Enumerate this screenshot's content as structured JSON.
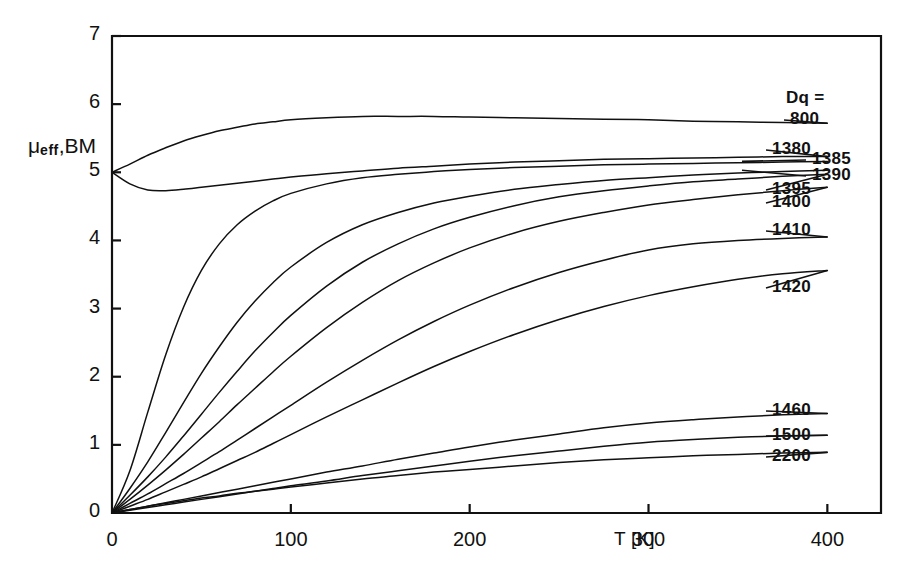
{
  "figure": {
    "background": "#ffffff",
    "line_color": "#111111",
    "frame": {
      "left": 112,
      "top": 36,
      "right": 881,
      "bottom": 513
    }
  },
  "axes": {
    "y_label_main": "eff",
    "y_label_prefix": "μ",
    "y_label_suffix": ",BM",
    "x_label": "T [K]",
    "y_ticks": [
      "0",
      "1",
      "2",
      "3",
      "4",
      "5",
      "6",
      "7"
    ],
    "x_ticks": [
      "0",
      "100",
      "200",
      "300",
      "400"
    ]
  },
  "legend": {
    "title": "Dq =",
    "entries": [
      "800",
      "1380",
      "1385",
      "1390",
      "1395",
      "1400",
      "1410",
      "1420",
      "1460",
      "1500",
      "2200"
    ]
  },
  "chart_data": {
    "type": "line",
    "title": "",
    "xlabel": "T [K]",
    "ylabel": "μ_eff, BM",
    "xlim": [
      0,
      430
    ],
    "ylim": [
      0,
      7
    ],
    "xticks": [
      0,
      100,
      200,
      300,
      400
    ],
    "yticks": [
      0,
      1,
      2,
      3,
      4,
      5,
      6,
      7
    ],
    "grid": false,
    "legend_position": "right-outside",
    "legend_title": "Dq =",
    "x": [
      0,
      10,
      20,
      30,
      40,
      50,
      60,
      70,
      80,
      90,
      100,
      120,
      140,
      160,
      180,
      200,
      225,
      250,
      275,
      300,
      325,
      350,
      375,
      400
    ],
    "series": [
      {
        "name": "800",
        "label": "800",
        "values": [
          5.0,
          5.12,
          5.25,
          5.36,
          5.46,
          5.54,
          5.61,
          5.66,
          5.71,
          5.74,
          5.77,
          5.8,
          5.82,
          5.82,
          5.82,
          5.81,
          5.8,
          5.79,
          5.78,
          5.77,
          5.75,
          5.74,
          5.73,
          5.72
        ]
      },
      {
        "name": "1380",
        "label": "1380",
        "values": [
          5.0,
          4.83,
          4.74,
          4.73,
          4.75,
          4.78,
          4.81,
          4.84,
          4.87,
          4.9,
          4.93,
          4.98,
          5.02,
          5.06,
          5.09,
          5.12,
          5.15,
          5.17,
          5.19,
          5.2,
          5.21,
          5.22,
          5.23,
          5.23
        ]
      },
      {
        "name": "1385",
        "label": "1385",
        "values": [
          0.0,
          0.62,
          1.48,
          2.32,
          3.02,
          3.56,
          3.95,
          4.23,
          4.43,
          4.58,
          4.69,
          4.83,
          4.92,
          4.97,
          5.01,
          5.04,
          5.07,
          5.09,
          5.11,
          5.12,
          5.13,
          5.14,
          5.15,
          5.16
        ]
      },
      {
        "name": "1390",
        "label": "1390",
        "values": [
          0.0,
          0.36,
          0.75,
          1.18,
          1.62,
          2.05,
          2.44,
          2.8,
          3.11,
          3.38,
          3.61,
          3.97,
          4.23,
          4.41,
          4.55,
          4.65,
          4.75,
          4.82,
          4.88,
          4.92,
          4.96,
          4.99,
          5.01,
          5.03
        ]
      },
      {
        "name": "1395",
        "label": "1395",
        "values": [
          0.0,
          0.26,
          0.53,
          0.82,
          1.13,
          1.45,
          1.77,
          2.08,
          2.38,
          2.65,
          2.9,
          3.33,
          3.68,
          3.95,
          4.17,
          4.34,
          4.51,
          4.64,
          4.73,
          4.8,
          4.86,
          4.9,
          4.94,
          4.97
        ]
      },
      {
        "name": "1400",
        "label": "1400",
        "values": [
          0.0,
          0.2,
          0.41,
          0.63,
          0.86,
          1.1,
          1.34,
          1.59,
          1.83,
          2.07,
          2.3,
          2.72,
          3.09,
          3.41,
          3.67,
          3.89,
          4.11,
          4.28,
          4.41,
          4.52,
          4.6,
          4.67,
          4.73,
          4.78
        ]
      },
      {
        "name": "1410",
        "label": "1410",
        "values": [
          0.0,
          0.14,
          0.28,
          0.43,
          0.58,
          0.74,
          0.9,
          1.07,
          1.24,
          1.41,
          1.58,
          1.92,
          2.24,
          2.54,
          2.81,
          3.05,
          3.31,
          3.53,
          3.71,
          3.86,
          3.95,
          4.0,
          4.03,
          4.05
        ]
      },
      {
        "name": "1420",
        "label": "1420",
        "values": [
          0.0,
          0.1,
          0.2,
          0.31,
          0.42,
          0.53,
          0.65,
          0.77,
          0.89,
          1.02,
          1.15,
          1.41,
          1.66,
          1.91,
          2.15,
          2.37,
          2.62,
          2.84,
          3.03,
          3.19,
          3.32,
          3.43,
          3.51,
          3.56
        ]
      },
      {
        "name": "1460",
        "label": "1460",
        "values": [
          0.0,
          0.05,
          0.1,
          0.15,
          0.2,
          0.25,
          0.3,
          0.35,
          0.4,
          0.45,
          0.5,
          0.6,
          0.69,
          0.79,
          0.88,
          0.97,
          1.07,
          1.16,
          1.25,
          1.32,
          1.37,
          1.41,
          1.44,
          1.46
        ]
      },
      {
        "name": "1500",
        "label": "1500",
        "values": [
          0.0,
          0.04,
          0.08,
          0.12,
          0.16,
          0.2,
          0.24,
          0.28,
          0.32,
          0.36,
          0.4,
          0.47,
          0.55,
          0.62,
          0.69,
          0.76,
          0.84,
          0.91,
          0.98,
          1.04,
          1.08,
          1.11,
          1.13,
          1.14
        ]
      },
      {
        "name": "2200",
        "label": "2200",
        "values": [
          0.0,
          0.05,
          0.1,
          0.14,
          0.18,
          0.22,
          0.25,
          0.29,
          0.32,
          0.35,
          0.38,
          0.44,
          0.5,
          0.55,
          0.6,
          0.64,
          0.69,
          0.74,
          0.78,
          0.81,
          0.84,
          0.86,
          0.88,
          0.89
        ]
      }
    ]
  }
}
